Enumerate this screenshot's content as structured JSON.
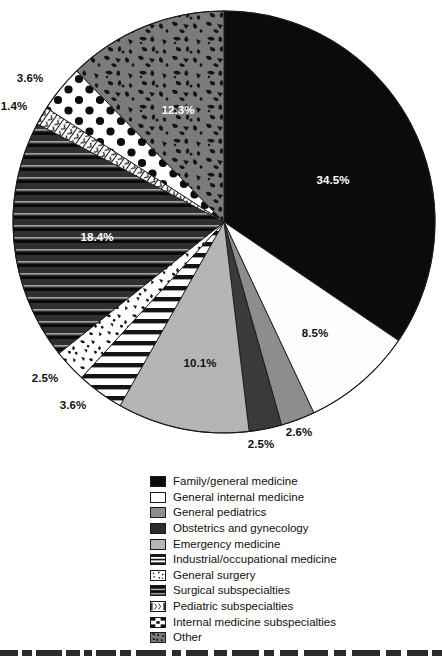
{
  "chart_data": {
    "type": "pie",
    "title": "",
    "subtitle": "",
    "xlabel": "",
    "ylabel": "",
    "units": "percent",
    "legend_position": "bottom",
    "start_angle_deg": 0,
    "direction": "clockwise",
    "categories": [
      "Family/general medicine",
      "General internal medicine",
      "General pediatrics",
      "Obstetrics and gynecology",
      "Emergency medicine",
      "Industrial/occupational medicine",
      "General surgery",
      "Surgical subspecialties",
      "Pediatric subspecialties",
      "Internal medicine subspecialties",
      "Other"
    ],
    "values": [
      34.5,
      8.5,
      2.6,
      2.5,
      10.1,
      3.6,
      2.5,
      18.4,
      1.4,
      3.6,
      12.3
    ],
    "value_labels": [
      "34.5%",
      "8.5%",
      "2.6%",
      "2.5%",
      "10.1%",
      "3.6%",
      "2.5%",
      "18.4%",
      "1.4%",
      "3.6%",
      "12.3%"
    ],
    "slices": [
      {
        "name": "Family/general medicine",
        "value": 34.5,
        "label": "34.5%",
        "fill": "solid-black",
        "color": "#0b0b0b",
        "label_color": "#ffffff",
        "label_x": 333,
        "label_y": 180
      },
      {
        "name": "General internal medicine",
        "value": 8.5,
        "label": "8.5%",
        "fill": "solid-white",
        "color": "#fdfdfd",
        "label_color": "#111111",
        "label_x": 315,
        "label_y": 333
      },
      {
        "name": "General pediatrics",
        "value": 2.6,
        "label": "2.6%",
        "fill": "solid-midgray",
        "color": "#8d8d8d",
        "label_color": "#111111",
        "label_x": 299,
        "label_y": 432
      },
      {
        "name": "Obstetrics and gynecology",
        "value": 2.5,
        "label": "2.5%",
        "fill": "solid-darkgray",
        "color": "#3a3a3a",
        "label_color": "#111111",
        "label_x": 261,
        "label_y": 444
      },
      {
        "name": "Emergency medicine",
        "value": 10.1,
        "label": "10.1%",
        "fill": "solid-lightgray",
        "color": "#b5b5b5",
        "label_color": "#111111",
        "label_x": 200,
        "label_y": 363
      },
      {
        "name": "Industrial/occupational medicine",
        "value": 3.6,
        "label": "3.6%",
        "fill": "horizontal-lines",
        "color": "#ffffff",
        "label_color": "#111111",
        "label_x": 73,
        "label_y": 405
      },
      {
        "name": "General surgery",
        "value": 2.5,
        "label": "2.5%",
        "fill": "confetti",
        "color": "#ffffff",
        "label_color": "#111111",
        "label_x": 45,
        "label_y": 378
      },
      {
        "name": "Surgical subspecialties",
        "value": 18.4,
        "label": "18.4%",
        "fill": "dark-stripes",
        "color": "#2e2e2e",
        "label_color": "#ffffff",
        "label_x": 97,
        "label_y": 237
      },
      {
        "name": "Pediatric subspecialties",
        "value": 1.4,
        "label": "1.4%",
        "fill": "fine-hatch",
        "color": "#ffffff",
        "label_color": "#111111",
        "label_x": 14,
        "label_y": 106
      },
      {
        "name": "Internal medicine subspecialties",
        "value": 3.6,
        "label": "3.6%",
        "fill": "polka-dots",
        "color": "#ffffff",
        "label_color": "#111111",
        "label_x": 30,
        "label_y": 78
      },
      {
        "name": "Other",
        "value": 12.3,
        "label": "12.3%",
        "fill": "squiggle-camo",
        "color": "#7a7a7a",
        "label_color": "#ffffff",
        "label_x": 178,
        "label_y": 110
      }
    ]
  },
  "legend": {
    "items": [
      {
        "label": "Family/general medicine",
        "pattern": "solid-black"
      },
      {
        "label": "General internal medicine",
        "pattern": "solid-white"
      },
      {
        "label": "General pediatrics",
        "pattern": "solid-midgray"
      },
      {
        "label": "Obstetrics and gynecology",
        "pattern": "solid-darkgray"
      },
      {
        "label": "Emergency medicine",
        "pattern": "solid-lightgray"
      },
      {
        "label": "Industrial/occupational medicine",
        "pattern": "horizontal-lines"
      },
      {
        "label": "General surgery",
        "pattern": "confetti"
      },
      {
        "label": "Surgical subspecialties",
        "pattern": "dark-stripes"
      },
      {
        "label": "Pediatric subspecialties",
        "pattern": "fine-hatch"
      },
      {
        "label": "Internal medicine subspecialties",
        "pattern": "polka-dots"
      },
      {
        "label": "Other",
        "pattern": "squiggle-camo"
      }
    ]
  },
  "geometry": {
    "center_x": 224,
    "center_y": 222,
    "radius": 211
  },
  "colors": {
    "black": "#0b0b0b",
    "white": "#ffffff",
    "dark_gray": "#3a3a3a",
    "mid_gray": "#8d8d8d",
    "light_gray": "#b5b5b5",
    "other_gray": "#7a7a7a",
    "outline": "#1a1a1a"
  }
}
